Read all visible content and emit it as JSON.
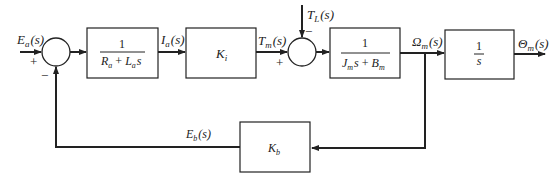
{
  "diagram": {
    "type": "block-diagram",
    "signals": {
      "input": "E_a(s)",
      "armature_current": "I_a(s)",
      "motor_torque": "T_m(s)",
      "load_torque": "T_L(s)",
      "angular_velocity": "Ω_m(s)",
      "output": "Θ_m(s)",
      "back_emf": "E_b(s)"
    },
    "labels": {
      "Ea_main": "E",
      "Ea_sub": "a",
      "Ea_arg": "(s)",
      "Ia_main": "I",
      "Ia_sub": "a",
      "Ia_arg": "(s)",
      "Tm_main": "T",
      "Tm_sub": "m",
      "Tm_arg": "(s)",
      "TL_main": "T",
      "TL_sub": "L",
      "TL_arg": "(s)",
      "Om_main": "Ω",
      "Om_sub": "m",
      "Om_arg": "(s)",
      "Th_main": "Θ",
      "Th_sub": "m",
      "Th_arg": "(s)",
      "Eb_main": "E",
      "Eb_sub": "b",
      "Eb_arg": "(s)"
    },
    "blocks": {
      "armature": {
        "numerator": "1",
        "den_R": "R",
        "den_R_sub": "a",
        "den_plus": "+",
        "den_L": "L",
        "den_L_sub": "a",
        "den_s": "s"
      },
      "torque_constant": {
        "main": "K",
        "sub": "i"
      },
      "mechanical": {
        "numerator": "1",
        "den_J": "J",
        "den_J_sub": "m",
        "den_s": "s",
        "den_plus": "+",
        "den_B": "B",
        "den_B_sub": "m"
      },
      "integrator": {
        "numerator": "1",
        "denominator": "s"
      },
      "back_emf_constant": {
        "main": "K",
        "sub": "b"
      }
    },
    "summing_junctions": {
      "sj1": {
        "plus": "+",
        "minus": "−"
      },
      "sj2": {
        "plus": "+",
        "minus": "−"
      }
    },
    "colors": {
      "line": "#222222",
      "background": "#ffffff"
    }
  }
}
